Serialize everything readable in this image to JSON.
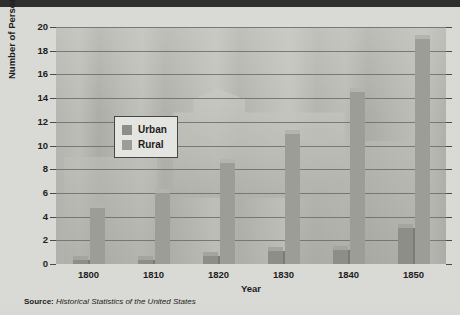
{
  "chart_data": {
    "type": "bar",
    "title": "",
    "xlabel": "Year",
    "ylabel": "Number of Persons (in millions)",
    "categories": [
      "1800",
      "1810",
      "1820",
      "1830",
      "1840",
      "1850"
    ],
    "series": [
      {
        "name": "Urban",
        "color": "#8e8e89",
        "values": [
          0.3,
          0.35,
          0.7,
          1.1,
          1.2,
          3.0
        ]
      },
      {
        "name": "Rural",
        "color": "#9d9d98",
        "values": [
          4.7,
          6.0,
          8.5,
          11.0,
          14.5,
          19.0
        ]
      }
    ],
    "ylim": [
      0,
      20
    ],
    "yticks": [
      0,
      2,
      4,
      6,
      8,
      10,
      12,
      14,
      16,
      18,
      20
    ],
    "grid": true,
    "legend_position": "upper-left-inside"
  },
  "legend": {
    "items": [
      {
        "label": "Urban"
      },
      {
        "label": "Rural"
      }
    ]
  },
  "source": {
    "prefix": "Source:",
    "text": "Historical Statistics of the United States"
  },
  "colors": {
    "urban": "#8e8e89",
    "rural": "#9d9d98",
    "background": "#d9d9d5",
    "plot_background": "#b9b9b4",
    "grid": "#6d6d68",
    "text": "#1d1d1d",
    "top_band": "#2e2e2e"
  }
}
